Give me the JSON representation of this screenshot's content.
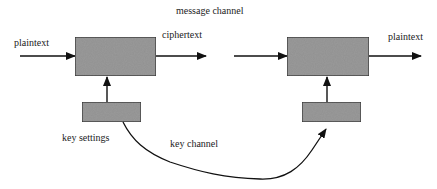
{
  "diagram": {
    "title": "message channel",
    "labels": {
      "input": "plaintext",
      "intermediate": "ciphertext",
      "output": "plaintext",
      "key_source": "key settings",
      "key_link": "key channel"
    },
    "nodes": [
      {
        "id": "encrypt-box",
        "kind": "process",
        "x": 75,
        "y": 37,
        "w": 81,
        "h": 39
      },
      {
        "id": "decrypt-box",
        "kind": "process",
        "x": 287,
        "y": 37,
        "w": 82,
        "h": 39
      },
      {
        "id": "key-settings-box-left",
        "kind": "key",
        "x": 82,
        "y": 102,
        "w": 59,
        "h": 20
      },
      {
        "id": "key-settings-box-right",
        "kind": "key",
        "x": 302,
        "y": 102,
        "w": 59,
        "h": 20
      }
    ],
    "edges": [
      {
        "from": "input",
        "to": "encrypt-box",
        "label": "plaintext"
      },
      {
        "from": "encrypt-box",
        "to": "channel",
        "label": "ciphertext"
      },
      {
        "from": "channel",
        "to": "decrypt-box"
      },
      {
        "from": "decrypt-box",
        "to": "output",
        "label": "plaintext"
      },
      {
        "from": "key-settings-box-left",
        "to": "encrypt-box"
      },
      {
        "from": "key-settings-box-right",
        "to": "decrypt-box"
      },
      {
        "from": "key-settings-box-left",
        "to": "key-settings-box-right",
        "label": "key channel"
      }
    ],
    "colors": {
      "box_fill": "#9a9a9a",
      "box_stroke": "#333333",
      "line": "#111111",
      "text": "#222222"
    }
  }
}
